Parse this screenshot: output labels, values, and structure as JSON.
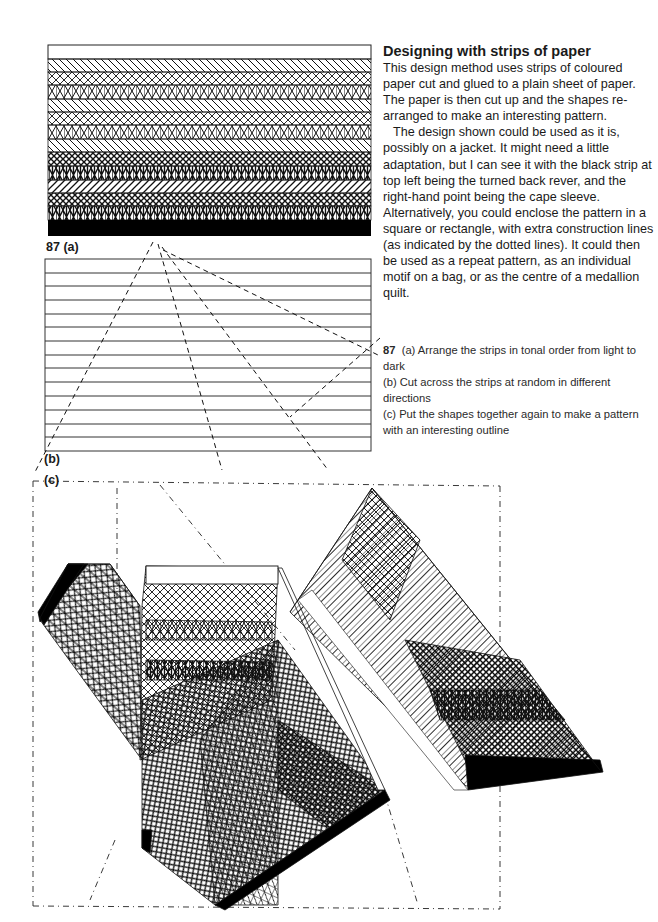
{
  "article": {
    "heading": "Designing with strips of paper",
    "paragraphs": [
      "This design method uses strips of coloured paper cut and glued to a plain sheet of paper. The paper is then cut up and the shapes re-arranged to make an interesting pattern.",
      "The design shown could be used as it is, possibly on a jacket. It might need a little adaptation, but I can see it with the black strip at top left being the turned back rever, and the right-hand point being the cape sleeve. Alternatively, you could enclose the pattern in a square or rectangle, with extra construction lines (as indicated by the dotted lines). It could then be used as a repeat pattern, as an individual motif on a bag, or as the centre of a medallion quilt."
    ]
  },
  "caption": {
    "number": "87",
    "lines": [
      "(a) Arrange the strips in tonal order from light to dark",
      "(b) Cut across the strips at random in different directions",
      "(c) Put the shapes together again to make a pattern with an interesting outline"
    ]
  },
  "figures": {
    "a": {
      "label": "87 (a)",
      "strips": [
        "blank",
        "diagonal",
        "cross",
        "cross-vertical",
        "diagonal",
        "cross",
        "cross-vertical",
        "diagonal",
        "cross-dense",
        "cross-vertical-dense",
        "diagonal-reverse",
        "cross-dense",
        "cross-vertical-dense",
        "black"
      ]
    },
    "b": {
      "label": "(b)",
      "strip_count": 14
    },
    "c": {
      "label": "(c)"
    }
  }
}
